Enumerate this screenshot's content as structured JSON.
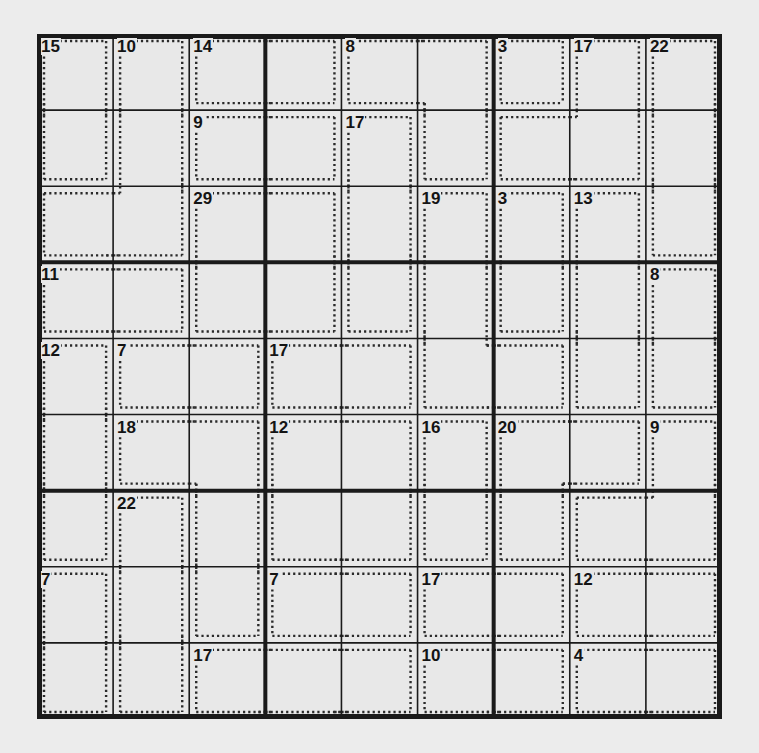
{
  "puzzle": {
    "type": "killer-sudoku",
    "size": 9,
    "box": 3,
    "colors": {
      "background": "#ececec",
      "cell": "#e8e8e8",
      "line": "#1a1a1a",
      "cage": "#2a2a2a"
    },
    "cages": [
      {
        "sum": "15",
        "cells": [
          [
            0,
            0
          ],
          [
            1,
            0
          ]
        ]
      },
      {
        "sum": "10",
        "cells": [
          [
            0,
            1
          ],
          [
            1,
            1
          ],
          [
            2,
            0
          ],
          [
            2,
            1
          ]
        ]
      },
      {
        "sum": "14",
        "cells": [
          [
            0,
            2
          ],
          [
            0,
            3
          ]
        ]
      },
      {
        "sum": "8",
        "cells": [
          [
            0,
            4
          ],
          [
            0,
            5
          ],
          [
            1,
            5
          ]
        ]
      },
      {
        "sum": "3",
        "cells": [
          [
            0,
            6
          ]
        ]
      },
      {
        "sum": "17",
        "cells": [
          [
            0,
            7
          ],
          [
            1,
            6
          ],
          [
            1,
            7
          ]
        ]
      },
      {
        "sum": "22",
        "cells": [
          [
            0,
            8
          ],
          [
            1,
            8
          ],
          [
            2,
            8
          ]
        ]
      },
      {
        "sum": "9",
        "cells": [
          [
            1,
            2
          ],
          [
            1,
            3
          ]
        ]
      },
      {
        "sum": "17",
        "cells": [
          [
            1,
            4
          ],
          [
            2,
            4
          ],
          [
            3,
            4
          ]
        ]
      },
      {
        "sum": "29",
        "cells": [
          [
            2,
            2
          ],
          [
            2,
            3
          ],
          [
            3,
            2
          ],
          [
            3,
            3
          ]
        ]
      },
      {
        "sum": "19",
        "cells": [
          [
            2,
            5
          ],
          [
            3,
            5
          ],
          [
            4,
            5
          ],
          [
            4,
            6
          ]
        ]
      },
      {
        "sum": "3",
        "cells": [
          [
            2,
            6
          ],
          [
            3,
            6
          ]
        ]
      },
      {
        "sum": "13",
        "cells": [
          [
            2,
            7
          ],
          [
            3,
            7
          ],
          [
            4,
            7
          ]
        ]
      },
      {
        "sum": "11",
        "cells": [
          [
            3,
            0
          ],
          [
            3,
            1
          ]
        ]
      },
      {
        "sum": "8",
        "cells": [
          [
            3,
            8
          ],
          [
            4,
            8
          ]
        ]
      },
      {
        "sum": "12",
        "cells": [
          [
            4,
            0
          ],
          [
            5,
            0
          ],
          [
            6,
            0
          ]
        ]
      },
      {
        "sum": "7",
        "cells": [
          [
            4,
            1
          ],
          [
            4,
            2
          ]
        ]
      },
      {
        "sum": "17",
        "cells": [
          [
            4,
            3
          ],
          [
            4,
            4
          ]
        ]
      },
      {
        "sum": "18",
        "cells": [
          [
            5,
            1
          ],
          [
            5,
            2
          ],
          [
            6,
            2
          ],
          [
            7,
            2
          ]
        ]
      },
      {
        "sum": "12",
        "cells": [
          [
            5,
            3
          ],
          [
            5,
            4
          ],
          [
            6,
            3
          ],
          [
            6,
            4
          ]
        ]
      },
      {
        "sum": "16",
        "cells": [
          [
            5,
            5
          ],
          [
            6,
            5
          ]
        ]
      },
      {
        "sum": "20",
        "cells": [
          [
            5,
            6
          ],
          [
            5,
            7
          ],
          [
            6,
            6
          ]
        ]
      },
      {
        "sum": "9",
        "cells": [
          [
            5,
            8
          ],
          [
            6,
            7
          ],
          [
            6,
            8
          ]
        ]
      },
      {
        "sum": "22",
        "cells": [
          [
            6,
            1
          ],
          [
            7,
            1
          ],
          [
            8,
            1
          ]
        ]
      },
      {
        "sum": "7",
        "cells": [
          [
            7,
            0
          ],
          [
            8,
            0
          ]
        ]
      },
      {
        "sum": "7",
        "cells": [
          [
            7,
            3
          ],
          [
            7,
            4
          ]
        ]
      },
      {
        "sum": "17",
        "cells": [
          [
            7,
            5
          ],
          [
            7,
            6
          ]
        ]
      },
      {
        "sum": "12",
        "cells": [
          [
            7,
            7
          ],
          [
            7,
            8
          ]
        ]
      },
      {
        "sum": "17",
        "cells": [
          [
            8,
            2
          ],
          [
            8,
            3
          ],
          [
            8,
            4
          ]
        ]
      },
      {
        "sum": "10",
        "cells": [
          [
            8,
            5
          ],
          [
            8,
            6
          ]
        ]
      },
      {
        "sum": "4",
        "cells": [
          [
            8,
            7
          ],
          [
            8,
            8
          ]
        ]
      }
    ]
  }
}
